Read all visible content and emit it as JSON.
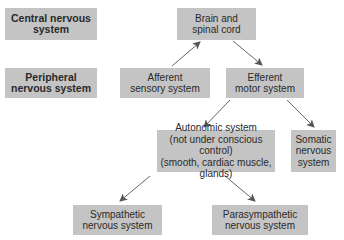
{
  "labels": {
    "central": "Central nervous\nsystem",
    "peripheral": "Peripheral\nnervous system"
  },
  "nodes": {
    "brain": "Brain and\nspinal cord",
    "afferent": "Afferent\nsensory system",
    "efferent": "Efferent\nmotor system",
    "autonomic": "Autonomic system\n(not under conscious control)\n(smooth, cardiac muscle, glands)",
    "somatic": "Somatic\nnervous\nsystem",
    "sympathetic": "Sympathetic\nnervous system",
    "parasympathetic": "Parasympathetic\nnervous system"
  },
  "colors": {
    "box": "#c4c4c4",
    "arrow": "#555555",
    "text": "#2a2a2a"
  }
}
